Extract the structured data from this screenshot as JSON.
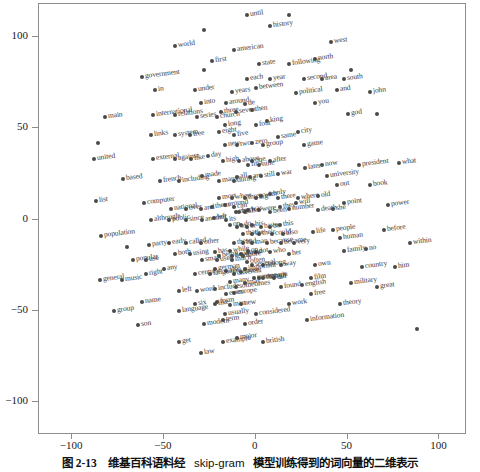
{
  "caption": {
    "figure_number": "图 2-13",
    "text_cjk_1": "维基百科语料经",
    "text_latin": "skip-gram",
    "text_cjk_2": "模型训练得到的词向量的二维表示",
    "full": "图 2-13  维基百科语料经 skip-gram 模型训练得到的词向量的二维表示"
  },
  "chart_data": {
    "type": "scatter",
    "title": "",
    "xlabel": "",
    "ylabel": "",
    "xlim": [
      -118,
      115
    ],
    "ylim": [
      -118,
      118
    ],
    "xticks": [
      -100,
      -50,
      0,
      50,
      100
    ],
    "yticks": [
      -100,
      -50,
      0,
      50,
      100
    ],
    "xtick_labels": [
      "-100",
      "-50",
      "0",
      "50",
      "100"
    ],
    "ytick_labels": [
      "-100",
      "-50",
      "0",
      "50",
      "100"
    ],
    "grid": false,
    "legend": "none",
    "marker_color": "#4a4a4a",
    "label_rotation_deg": -7,
    "points": [
      {
        "label": "until",
        "x": -5,
        "y": 112
      },
      {
        "label": "",
        "x": 18,
        "y": 112
      },
      {
        "label": "history",
        "x": 8,
        "y": 106
      },
      {
        "label": "",
        "x": -28,
        "y": 104
      },
      {
        "label": "west",
        "x": 41,
        "y": 97
      },
      {
        "label": "world",
        "x": -44,
        "y": 95
      },
      {
        "label": "american",
        "x": -12,
        "y": 93
      },
      {
        "label": "first",
        "x": -24,
        "y": 87
      },
      {
        "label": "state",
        "x": 2,
        "y": 85
      },
      {
        "label": "following",
        "x": 18,
        "y": 85
      },
      {
        "label": "north",
        "x": 32,
        "y": 88
      },
      {
        "label": "",
        "x": 52,
        "y": 82
      },
      {
        "label": "government",
        "x": -62,
        "y": 78
      },
      {
        "label": "",
        "x": -28,
        "y": 82
      },
      {
        "label": "each",
        "x": -5,
        "y": 77
      },
      {
        "label": "year",
        "x": 8,
        "y": 77
      },
      {
        "label": "second",
        "x": 26,
        "y": 77
      },
      {
        "label": "area",
        "x": 36,
        "y": 77
      },
      {
        "label": "south",
        "x": 48,
        "y": 77
      },
      {
        "label": "in",
        "x": -55,
        "y": 71
      },
      {
        "label": "under",
        "x": -33,
        "y": 71
      },
      {
        "label": "years",
        "x": -13,
        "y": 70
      },
      {
        "label": "between",
        "x": 0,
        "y": 72
      },
      {
        "label": "political",
        "x": 22,
        "y": 69
      },
      {
        "label": "and",
        "x": 44,
        "y": 71
      },
      {
        "label": "john",
        "x": 62,
        "y": 70
      },
      {
        "label": "into",
        "x": -30,
        "y": 64
      },
      {
        "label": "around",
        "x": -16,
        "y": 64
      },
      {
        "label": "de",
        "x": -6,
        "y": 63
      },
      {
        "label": "you",
        "x": 32,
        "y": 64
      },
      {
        "label": "main",
        "x": -82,
        "y": 56
      },
      {
        "label": "international",
        "x": -56,
        "y": 57
      },
      {
        "label": "relations",
        "x": -44,
        "y": 57
      },
      {
        "label": "series",
        "x": -32,
        "y": 56
      },
      {
        "label": "church",
        "x": -21,
        "y": 56
      },
      {
        "label": "three",
        "x": -19,
        "y": 59
      },
      {
        "label": "seven",
        "x": -11,
        "y": 59
      },
      {
        "label": "then",
        "x": -2,
        "y": 60
      },
      {
        "label": "god",
        "x": 50,
        "y": 58
      },
      {
        "label": "",
        "x": 66,
        "y": 58
      },
      {
        "label": "long",
        "x": -17,
        "y": 52
      },
      {
        "label": "four",
        "x": 0,
        "y": 52
      },
      {
        "label": "king",
        "x": 6,
        "y": 54
      },
      {
        "label": "links",
        "x": -57,
        "y": 46
      },
      {
        "label": "system",
        "x": -44,
        "y": 46
      },
      {
        "label": "free",
        "x": -36,
        "y": 46
      },
      {
        "label": "eight",
        "x": -20,
        "y": 48
      },
      {
        "label": "five",
        "x": -12,
        "y": 46
      },
      {
        "label": "city",
        "x": 23,
        "y": 48
      },
      {
        "label": "",
        "x": -86,
        "y": 42
      },
      {
        "label": "united",
        "x": -88,
        "y": 33
      },
      {
        "label": "external",
        "x": -56,
        "y": 33
      },
      {
        "label": "against",
        "x": -44,
        "y": 33
      },
      {
        "label": "like",
        "x": -35,
        "y": 33
      },
      {
        "label": "day",
        "x": -26,
        "y": 35
      },
      {
        "label": "new",
        "x": -17,
        "y": 41
      },
      {
        "label": "two",
        "x": -10,
        "y": 41
      },
      {
        "label": "zero",
        "x": -2,
        "y": 42
      },
      {
        "label": "group",
        "x": 4,
        "y": 41
      },
      {
        "label": "same",
        "x": 12,
        "y": 45
      },
      {
        "label": "game",
        "x": 26,
        "y": 41
      },
      {
        "label": "high",
        "x": -18,
        "y": 32
      },
      {
        "label": "above",
        "x": -9,
        "y": 32
      },
      {
        "label": "one",
        "x": -2,
        "y": 32
      },
      {
        "label": "now",
        "x": 36,
        "y": 30
      },
      {
        "label": "president",
        "x": 56,
        "y": 30
      },
      {
        "label": "what",
        "x": 78,
        "y": 31
      },
      {
        "label": "based",
        "x": -72,
        "y": 22
      },
      {
        "label": "french",
        "x": -52,
        "y": 21
      },
      {
        "label": "including",
        "x": -42,
        "y": 21
      },
      {
        "label": "made",
        "x": -29,
        "y": 24
      },
      {
        "label": "first",
        "x": -4,
        "y": 30
      },
      {
        "label": "nine",
        "x": 2,
        "y": 30
      },
      {
        "label": "after",
        "x": 8,
        "y": 32
      },
      {
        "label": "later",
        "x": 27,
        "y": 28
      },
      {
        "label": "university",
        "x": 39,
        "y": 24
      },
      {
        "label": "many",
        "x": -20,
        "y": 21
      },
      {
        "label": "during",
        "x": -12,
        "y": 21
      },
      {
        "label": "all",
        "x": -10,
        "y": 23
      },
      {
        "label": "are",
        "x": -3,
        "y": 23
      },
      {
        "label": "still",
        "x": 3,
        "y": 24
      },
      {
        "label": "war",
        "x": 12,
        "y": 25
      },
      {
        "label": "out",
        "x": 44,
        "y": 19
      },
      {
        "label": "book",
        "x": 62,
        "y": 19
      },
      {
        "label": "list",
        "x": -87,
        "y": 10
      },
      {
        "label": "computer",
        "x": -61,
        "y": 9
      },
      {
        "label": "national",
        "x": -46,
        "y": 6
      },
      {
        "label": "over",
        "x": -38,
        "y": 6
      },
      {
        "label": "and",
        "x": -30,
        "y": 6
      },
      {
        "label": "them",
        "x": -24,
        "y": 7
      },
      {
        "label": "most",
        "x": -20,
        "y": 12
      },
      {
        "label": "when",
        "x": -13,
        "y": 12
      },
      {
        "label": "three",
        "x": -6,
        "y": 12
      },
      {
        "label": "big",
        "x": 0,
        "y": 12
      },
      {
        "label": "with",
        "x": 3,
        "y": 13
      },
      {
        "label": "only",
        "x": 8,
        "y": 14
      },
      {
        "label": "there",
        "x": 12,
        "y": 12
      },
      {
        "label": "where",
        "x": 23,
        "y": 12
      },
      {
        "label": "old",
        "x": 34,
        "y": 13
      },
      {
        "label": "point",
        "x": 48,
        "y": 9
      },
      {
        "label": "power",
        "x": 72,
        "y": 8
      },
      {
        "label": "although",
        "x": -57,
        "y": 0
      },
      {
        "label": "public",
        "x": -47,
        "y": 0
      },
      {
        "label": "since",
        "x": -38,
        "y": 0
      },
      {
        "label": "another",
        "x": -29,
        "y": 0
      },
      {
        "label": "left",
        "x": -23,
        "y": 1
      },
      {
        "label": "its",
        "x": -16,
        "y": 0
      },
      {
        "label": "much",
        "x": -11,
        "y": 4
      },
      {
        "label": "also",
        "x": -6,
        "y": 4
      },
      {
        "label": "can",
        "x": -12,
        "y": 7
      },
      {
        "label": "around",
        "x": -17,
        "y": 8
      },
      {
        "label": "she",
        "x": 42,
        "y": 6
      },
      {
        "label": "death",
        "x": 34,
        "y": 5
      },
      {
        "label": "number",
        "x": 18,
        "y": 6
      },
      {
        "label": "will",
        "x": 22,
        "y": 9
      },
      {
        "label": "they",
        "x": 13,
        "y": 7
      },
      {
        "label": "been",
        "x": 8,
        "y": 4
      },
      {
        "label": "were",
        "x": 2,
        "y": 5
      },
      {
        "label": "was",
        "x": -4,
        "y": 5
      },
      {
        "label": "by",
        "x": -9,
        "y": 4
      },
      {
        "label": "population",
        "x": -84,
        "y": -9
      },
      {
        "label": "or",
        "x": -5,
        "y": -4
      },
      {
        "label": "so",
        "x": -10,
        "y": -4
      },
      {
        "label": "on",
        "x": -14,
        "y": -3
      },
      {
        "label": "do",
        "x": -8,
        "y": -3
      },
      {
        "label": "his",
        "x": -2,
        "y": -3
      },
      {
        "label": "have",
        "x": 3,
        "y": -4
      },
      {
        "label": "be",
        "x": 8,
        "y": -4
      },
      {
        "label": "this",
        "x": 13,
        "y": -3
      },
      {
        "label": "life",
        "x": 31,
        "y": -7
      },
      {
        "label": "people",
        "x": 42,
        "y": -6
      },
      {
        "label": "before",
        "x": 70,
        "y": -6
      },
      {
        "label": "that",
        "x": -7,
        "y": -8
      },
      {
        "label": "the",
        "x": -2,
        "y": -8
      },
      {
        "label": "their",
        "x": 2,
        "y": -8
      },
      {
        "label": "could",
        "x": 9,
        "y": -8
      },
      {
        "label": "also",
        "x": 15,
        "y": -8
      },
      {
        "label": "human",
        "x": 46,
        "y": -10
      },
      {
        "label": "party",
        "x": -58,
        "y": -14
      },
      {
        "label": "early",
        "x": -47,
        "y": -13
      },
      {
        "label": "called",
        "x": -38,
        "y": -13
      },
      {
        "label": "other",
        "x": -30,
        "y": -13
      },
      {
        "label": "these",
        "x": -12,
        "y": -13
      },
      {
        "label": "had",
        "x": -7,
        "y": -13
      },
      {
        "label": "man",
        "x": -2,
        "y": -13
      },
      {
        "label": "because",
        "x": 6,
        "y": -13
      },
      {
        "label": "became",
        "x": 14,
        "y": -13
      },
      {
        "label": "very",
        "x": 21,
        "y": -13
      },
      {
        "label": "within",
        "x": 84,
        "y": -13
      },
      {
        "label": "",
        "x": -70,
        "y": -15
      },
      {
        "label": "both",
        "x": -44,
        "y": -19
      },
      {
        "label": "using",
        "x": -36,
        "y": -19
      },
      {
        "label": "has",
        "x": -22,
        "y": -18
      },
      {
        "label": "while",
        "x": -14,
        "y": -17
      },
      {
        "label": "would",
        "x": -8,
        "y": -19
      },
      {
        "label": "not",
        "x": 0,
        "y": -18
      },
      {
        "label": "or",
        "x": -4,
        "y": -17
      },
      {
        "label": "who",
        "x": 8,
        "y": -18
      },
      {
        "label": "her",
        "x": 18,
        "y": -19
      },
      {
        "label": "family",
        "x": 48,
        "y": -17
      },
      {
        "label": "no",
        "x": 60,
        "y": -16
      },
      {
        "label": "popular",
        "x": -67,
        "y": -22
      },
      {
        "label": "use",
        "x": -60,
        "y": -22
      },
      {
        "label": "small",
        "x": -29,
        "y": -22
      },
      {
        "label": "used",
        "x": -21,
        "y": -22
      },
      {
        "label": "much",
        "x": -13,
        "y": -22
      },
      {
        "label": "being",
        "x": -20,
        "y": -20
      },
      {
        "label": "however",
        "x": -13,
        "y": -20
      },
      {
        "label": "more",
        "x": -7,
        "y": -20
      },
      {
        "label": "often",
        "x": -5,
        "y": -23
      },
      {
        "label": "several",
        "x": -2,
        "y": -25
      },
      {
        "label": "among",
        "x": 4,
        "y": -25
      },
      {
        "label": "way",
        "x": 14,
        "y": -25
      },
      {
        "label": "own",
        "x": 32,
        "y": -25
      },
      {
        "label": "country",
        "x": 58,
        "y": -26
      },
      {
        "label": "him",
        "x": 76,
        "y": -26
      },
      {
        "label": "right",
        "x": -60,
        "y": -30
      },
      {
        "label": "any",
        "x": -50,
        "y": -27
      },
      {
        "label": "century",
        "x": -33,
        "y": -30
      },
      {
        "label": "german",
        "x": -22,
        "y": -27
      },
      {
        "label": "different",
        "x": -12,
        "y": -30
      },
      {
        "label": "important",
        "x": -6,
        "y": -27
      },
      {
        "label": "also",
        "x": -16,
        "y": -28
      },
      {
        "label": "those",
        "x": -8,
        "y": -29
      },
      {
        "label": "general",
        "x": -85,
        "y": -33
      },
      {
        "label": "music",
        "x": -73,
        "y": -33
      },
      {
        "label": "europe",
        "x": -1,
        "y": -32
      },
      {
        "label": "language",
        "x": -25,
        "y": -30
      },
      {
        "label": "common",
        "x": 2,
        "y": -32
      },
      {
        "label": "did",
        "x": 10,
        "y": -32
      },
      {
        "label": "though",
        "x": 4,
        "y": -32
      },
      {
        "label": "film",
        "x": 30,
        "y": -32
      },
      {
        "label": "many",
        "x": -14,
        "y": -34
      },
      {
        "label": "may",
        "x": -6,
        "y": -35
      },
      {
        "label": "left",
        "x": -42,
        "y": -39
      },
      {
        "label": "word",
        "x": -32,
        "y": -39
      },
      {
        "label": "include",
        "x": -22,
        "y": -38
      },
      {
        "label": "europe",
        "x": -12,
        "y": -40
      },
      {
        "label": "english",
        "x": 25,
        "y": -36
      },
      {
        "label": "military",
        "x": 52,
        "y": -35
      },
      {
        "label": "great",
        "x": 66,
        "y": -37
      },
      {
        "label": "sometimes",
        "x": -11,
        "y": -37
      },
      {
        "label": "found",
        "x": 14,
        "y": -37
      },
      {
        "label": "name",
        "x": -62,
        "y": -45
      },
      {
        "label": "six",
        "x": -33,
        "y": -46
      },
      {
        "label": "form",
        "x": -21,
        "y": -45
      },
      {
        "label": "free",
        "x": 30,
        "y": -41
      },
      {
        "label": "even",
        "x": -16,
        "y": -41
      },
      {
        "label": "group",
        "x": -77,
        "y": -50
      },
      {
        "label": "language",
        "x": -42,
        "y": -50
      },
      {
        "label": "man",
        "x": -14,
        "y": -47
      },
      {
        "label": "new",
        "x": -8,
        "y": -46
      },
      {
        "label": "work",
        "x": 18,
        "y": -46
      },
      {
        "label": "like",
        "x": -22,
        "y": -46
      },
      {
        "label": "theory",
        "x": 46,
        "y": -46
      },
      {
        "label": "son",
        "x": -64,
        "y": -58
      },
      {
        "label": "modern",
        "x": -28,
        "y": -57
      },
      {
        "label": "term",
        "x": -18,
        "y": -55
      },
      {
        "label": "usually",
        "x": -17,
        "y": -52
      },
      {
        "label": "considered",
        "x": 0,
        "y": -52
      },
      {
        "label": "information",
        "x": 28,
        "y": -55
      },
      {
        "label": "order",
        "x": -6,
        "y": -57
      },
      {
        "label": "get",
        "x": -42,
        "y": -67
      },
      {
        "label": "law",
        "x": -30,
        "y": -73
      },
      {
        "label": "example",
        "x": -18,
        "y": -67
      },
      {
        "label": "major",
        "x": -10,
        "y": -65
      },
      {
        "label": "british",
        "x": 4,
        "y": -67
      },
      {
        "label": "",
        "x": 88,
        "y": -60
      }
    ]
  }
}
